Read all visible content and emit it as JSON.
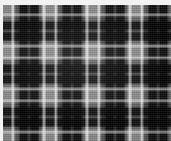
{
  "image": {
    "kind": "textile-swatch-photograph",
    "subject": "tartan plaid fabric",
    "width_px": 171,
    "height_px": 141,
    "colorway": "black / charcoal / grey monochrome",
    "border": {
      "top_strip_px": 5,
      "left_strip_px": 3,
      "strip_color": "#f2f2f0"
    }
  },
  "palette": {
    "black": "#0d0d0d",
    "near_black": "#1a1a1a",
    "dark_charcoal": "#242424",
    "charcoal": "#3a3a3a",
    "mid_grey": "#575757",
    "light_grey": "#6e6e6e",
    "pale_grey": "#8a8a8a",
    "accent_white": "#c9c9c9",
    "background": "#ffffff"
  },
  "chart_data": {
    "type": "heatmap",
    "xlabel": "warp threads (px across)",
    "ylabel": "weft threads (px down)",
    "repeat_px": 43,
    "grid": false,
    "legend_position": "none",
    "warp_sett": [
      {
        "offset": 0,
        "width": 9,
        "color": "#8a8a8a",
        "name": "pale-grey-ground"
      },
      {
        "offset": 9,
        "width": 2,
        "color": "#c9c9c9",
        "name": "white-pivot-line"
      },
      {
        "offset": 11,
        "width": 5,
        "color": "#6e6e6e",
        "name": "light-grey-band"
      },
      {
        "offset": 16,
        "width": 8,
        "color": "#0d0d0d",
        "name": "black-block"
      },
      {
        "offset": 24,
        "width": 3,
        "color": "#575757",
        "name": "mid-grey-gap"
      },
      {
        "offset": 27,
        "width": 8,
        "color": "#0d0d0d",
        "name": "black-block"
      },
      {
        "offset": 35,
        "width": 5,
        "color": "#6e6e6e",
        "name": "light-grey-band"
      },
      {
        "offset": 40,
        "width": 3,
        "color": "#c9c9c9",
        "name": "white-pivot-line"
      }
    ],
    "weft_sett": [
      {
        "offset": 0,
        "height": 9,
        "color": "#8a8a8a",
        "name": "pale-grey-ground"
      },
      {
        "offset": 9,
        "height": 2,
        "color": "#c9c9c9",
        "name": "white-pivot-line"
      },
      {
        "offset": 11,
        "height": 5,
        "color": "#6e6e6e",
        "name": "light-grey-band"
      },
      {
        "offset": 16,
        "height": 8,
        "color": "#0d0d0d",
        "name": "black-block"
      },
      {
        "offset": 24,
        "height": 3,
        "color": "#575757",
        "name": "mid-grey-gap"
      },
      {
        "offset": 27,
        "height": 8,
        "color": "#0d0d0d",
        "name": "black-block"
      },
      {
        "offset": 35,
        "height": 5,
        "color": "#6e6e6e",
        "name": "light-grey-band"
      },
      {
        "offset": 40,
        "height": 3,
        "color": "#c9c9c9",
        "name": "white-pivot-line"
      }
    ]
  },
  "layers": {
    "warp_dark_gradient": "repeating-linear-gradient(to right, rgba(0,0,0,0.00) 0px, rgba(0,0,0,0.00) 9px, rgba(0,0,0,0.10) 11px, rgba(0,0,0,0.28) 13px, rgba(0,0,0,0.30) 16px, rgba(0,0,0,0.86) 17px, rgba(0,0,0,0.88) 24px, rgba(0,0,0,0.52) 25px, rgba(0,0,0,0.50) 27px, rgba(0,0,0,0.88) 28px, rgba(0,0,0,0.86) 35px, rgba(0,0,0,0.30) 36px, rgba(0,0,0,0.12) 39px, rgba(0,0,0,0.00) 43px)",
    "weft_dark_gradient": "repeating-linear-gradient(to bottom, rgba(0,0,0,0.00) 0px, rgba(0,0,0,0.00) 9px, rgba(0,0,0,0.10) 11px, rgba(0,0,0,0.28) 13px, rgba(0,0,0,0.30) 16px, rgba(0,0,0,0.86) 17px, rgba(0,0,0,0.88) 24px, rgba(0,0,0,0.52) 25px, rgba(0,0,0,0.50) 27px, rgba(0,0,0,0.88) 28px, rgba(0,0,0,0.86) 35px, rgba(0,0,0,0.30) 36px, rgba(0,0,0,0.12) 39px, rgba(0,0,0,0.00) 43px)",
    "warp_light_gradient": "repeating-linear-gradient(to right, rgba(255,255,255,0.00) 0px, rgba(255,255,255,0.00) 8px, rgba(255,255,255,0.55) 9px, rgba(255,255,255,0.58) 10px, rgba(255,255,255,0.00) 12px, rgba(255,255,255,0.00) 39px, rgba(255,255,255,0.50) 40px, rgba(255,255,255,0.55) 42px, rgba(255,255,255,0.00) 43px)",
    "weft_light_gradient": "repeating-linear-gradient(to bottom, rgba(255,255,255,0.00) 0px, rgba(255,255,255,0.00) 8px, rgba(255,255,255,0.48) 9px, rgba(255,255,255,0.52) 10px, rgba(255,255,255,0.00) 12px, rgba(255,255,255,0.00) 39px, rgba(255,255,255,0.44) 40px, rgba(255,255,255,0.50) 42px, rgba(255,255,255,0.00) 43px)",
    "base_ground_gradient": "repeating-linear-gradient(to right, #8a8a8a 0px, #8a8a8a 9px, #c9c9c9 10px, #7f7f7f 12px, #6e6e6e 16px, #6e6e6e 35px, #7f7f7f 38px, #c2c2c2 41px, #8a8a8a 43px)"
  }
}
